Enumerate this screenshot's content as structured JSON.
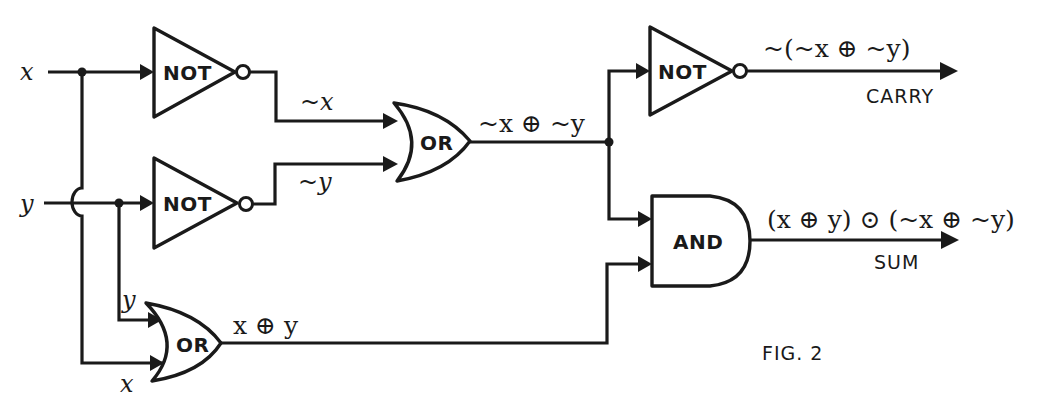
{
  "figure": {
    "caption": "FIG. 2",
    "inputs": {
      "x": "x",
      "y": "y"
    },
    "gates": [
      {
        "id": "not1",
        "type": "NOT",
        "label": "NOT",
        "input": "x",
        "output": "~x"
      },
      {
        "id": "not2",
        "type": "NOT",
        "label": "NOT",
        "input": "y",
        "output": "~y"
      },
      {
        "id": "or1",
        "type": "OR",
        "label": "OR",
        "inputs": [
          "~x",
          "~y"
        ],
        "output": "~x ⊕ ~y"
      },
      {
        "id": "or2",
        "type": "OR",
        "label": "OR",
        "inputs": [
          "y",
          "x"
        ],
        "output": "x ⊕ y"
      },
      {
        "id": "not3",
        "type": "NOT",
        "label": "NOT",
        "input": "~x ⊕ ~y",
        "output": "~(~x ⊕ ~y)"
      },
      {
        "id": "and1",
        "type": "AND",
        "label": "AND",
        "inputs": [
          "~x ⊕ ~y",
          "x ⊕ y"
        ],
        "output": "(x ⊕ y) ⊙ (~x ⊕ ~y)"
      }
    ],
    "signals": {
      "not_x": "~x",
      "not_y": "~y",
      "or1_out": "~x ⊕ ~y",
      "or2_in_y": "y",
      "or2_in_x": "x",
      "or2_out": "x ⊕ y",
      "carry_expr": "~(~x ⊕ ~y)",
      "sum_expr": "(x ⊕ y) ⊙ (~x ⊕ ~y)"
    },
    "outputs": {
      "carry": "CARRY",
      "sum": "SUM"
    }
  }
}
